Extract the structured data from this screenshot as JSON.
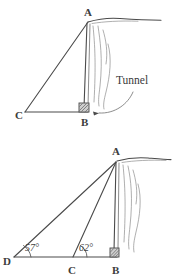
{
  "document": {
    "title": "Cliff and Tunnel Angle of Elevation Diagrams",
    "background_color": "#ffffff",
    "ink_color": "#4a4a4a",
    "width": 172,
    "height": 279
  },
  "figures": [
    {
      "id": "figure-top",
      "name": "cliff-with-tunnel-right-triangle",
      "description": "Right triangle ABC against a cliff face with a tunnel opening at B",
      "vertices": [
        {
          "label": "A",
          "x": 88,
          "y": 22,
          "label_x": 84,
          "label_y": 16
        },
        {
          "label": "B",
          "x": 85,
          "y": 110,
          "label_x": 81,
          "label_y": 126
        },
        {
          "label": "C",
          "x": 25,
          "y": 112,
          "label_x": 16,
          "label_y": 118
        }
      ],
      "right_angle_at": "B",
      "callout": {
        "label": "Tunnel",
        "label_x": 118,
        "label_y": 80,
        "pointer_from_x": 116,
        "pointer_from_y": 86,
        "pointer_to_x": 90,
        "pointer_to_y": 111
      }
    },
    {
      "id": "figure-bottom",
      "name": "cliff-with-two-angles-of-elevation",
      "description": "Triangle with apex A above B, and baseline D-C-B showing two angles of elevation",
      "vertices": [
        {
          "label": "A",
          "x": 117,
          "y": 161,
          "label_x": 113,
          "label_y": 155
        },
        {
          "label": "B",
          "x": 117,
          "y": 257,
          "label_x": 113,
          "label_y": 272
        },
        {
          "label": "C",
          "x": 73,
          "y": 257,
          "label_x": 69,
          "label_y": 272
        },
        {
          "label": "D",
          "x": 14,
          "y": 257,
          "label_x": 5,
          "label_y": 264
        }
      ],
      "right_angle_at": "B",
      "angles": [
        {
          "id": "angle-D",
          "value": "57°",
          "at_vertex": "D",
          "label_x": 26,
          "label_y": 250
        },
        {
          "id": "angle-C",
          "value": "62°",
          "at_vertex": "C",
          "label_x": 80,
          "label_y": 250
        }
      ]
    }
  ],
  "labels": {
    "vertex_a": "A",
    "vertex_b": "B",
    "vertex_c": "C",
    "vertex_d": "D",
    "tunnel": "Tunnel",
    "angle_57": "57°",
    "angle_62": "62°"
  }
}
